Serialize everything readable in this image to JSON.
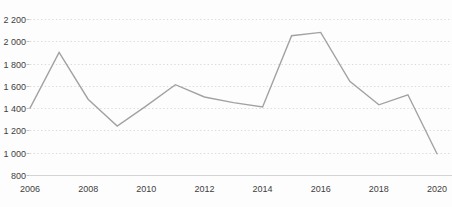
{
  "chart_data": {
    "type": "line",
    "title": "",
    "xlabel": "",
    "ylabel": "",
    "legend": "none",
    "grid": "horizontal-dotted",
    "x": [
      2006,
      2007,
      2008,
      2009,
      2010,
      2011,
      2012,
      2013,
      2014,
      2015,
      2016,
      2017,
      2018,
      2019,
      2020
    ],
    "values": [
      1400,
      1900,
      1480,
      1240,
      1420,
      1610,
      1500,
      1450,
      1410,
      2050,
      2080,
      1640,
      1430,
      1520,
      990
    ],
    "xlim": [
      2006,
      2020
    ],
    "ylim": [
      800,
      2200
    ],
    "y_ticks": [
      {
        "value": 2200,
        "label": "2 200"
      },
      {
        "value": 2000,
        "label": "2 000"
      },
      {
        "value": 1800,
        "label": "1 800"
      },
      {
        "value": 1600,
        "label": "1 600"
      },
      {
        "value": 1400,
        "label": "1 400"
      },
      {
        "value": 1200,
        "label": "1 200"
      },
      {
        "value": 1000,
        "label": "1 000"
      },
      {
        "value": 800,
        "label": "800"
      }
    ],
    "x_ticks": [
      {
        "value": 2006,
        "label": "2006"
      },
      {
        "value": 2008,
        "label": "2008"
      },
      {
        "value": 2010,
        "label": "2010"
      },
      {
        "value": 2012,
        "label": "2012"
      },
      {
        "value": 2014,
        "label": "2014"
      },
      {
        "value": 2016,
        "label": "2016"
      },
      {
        "value": 2018,
        "label": "2018"
      },
      {
        "value": 2020,
        "label": "2020"
      }
    ],
    "colors": {
      "line": "#a2a2a2",
      "grid": "#d9d9d9",
      "axis": "#d4d4d4",
      "tick": "#c2c2c2",
      "label": "#3d3d3d",
      "background": "#fdfdfd"
    }
  }
}
